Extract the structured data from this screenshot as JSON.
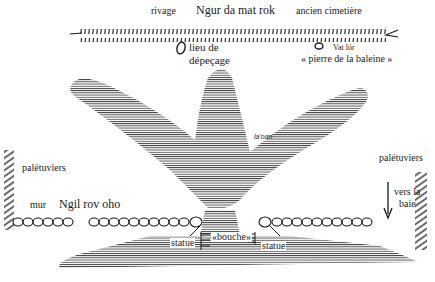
{
  "top_labels": {
    "rivage": "rivage",
    "place_name": "Ngur da mat rok",
    "cemetery": "ancien cimetière"
  },
  "shore_labels": {
    "butchering_site_line1": "lieu de",
    "butchering_site_line2": "dépeçage",
    "stone_name": "Vat lór",
    "stone_gloss": "« pierre de la baleine »"
  },
  "figure_label": "la'oan",
  "left_labels": {
    "mangroves": "palétuviers",
    "wall": "mur",
    "wall_name": "Ngil rov oho"
  },
  "right_labels": {
    "mangroves": "palétuviers",
    "direction_line1": "vers la",
    "direction_line2": "baie"
  },
  "center_labels": {
    "statue_left": "statue",
    "mouth": "«bouche»",
    "statue_right": "statue"
  },
  "colors": {
    "ink": "#1a1a1a",
    "hatch": "#3a3a3a",
    "background": "#ffffff"
  }
}
